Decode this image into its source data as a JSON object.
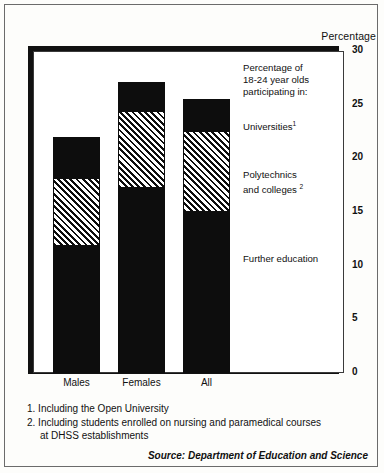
{
  "chart_data": {
    "type": "bar",
    "subtype": "stacked",
    "title": "",
    "axis_title": "Percentage",
    "xlabel": "",
    "ylabel": "Percentage",
    "ylim": [
      0,
      30
    ],
    "yticks": [
      "30",
      "25",
      "20",
      "15",
      "10",
      "5",
      "0"
    ],
    "ytick_values": [
      30,
      25,
      20,
      15,
      10,
      5,
      0
    ],
    "grid": false,
    "legend_position": "inside-right",
    "categories": [
      "Males",
      "Females",
      "All"
    ],
    "series": [
      {
        "name": "Further education",
        "values": [
          11.9,
          17.3,
          15.1
        ],
        "fill": "solid-black"
      },
      {
        "name": "Polytechnics and colleges",
        "values": [
          6.2,
          7.0,
          7.4
        ],
        "fill": "diagonal-hatch"
      },
      {
        "name": "Universities",
        "values": [
          3.9,
          2.8,
          3.0
        ],
        "fill": "solid-black"
      }
    ],
    "totals": [
      22.0,
      27.1,
      25.5
    ],
    "legend_heading": "Percentage of\n18-24 year olds\nparticipating in:"
  },
  "axis": {
    "title": "Percentage",
    "ticks": [
      "30",
      "25",
      "20",
      "15",
      "10",
      "5",
      "0"
    ]
  },
  "legend": {
    "heading_line1": "Percentage of",
    "heading_line2": "18-24 year olds",
    "heading_line3": "participating in:",
    "universities": "Universities",
    "universities_note": "1",
    "polytechnics_line1": "Polytechnics",
    "polytechnics_line2": "and colleges",
    "polytechnics_note": "2",
    "further_education": "Further education"
  },
  "categories": [
    {
      "label": "Males"
    },
    {
      "label": "Females"
    },
    {
      "label": "All"
    }
  ],
  "footnotes": [
    {
      "text": "1. Including the Open University"
    },
    {
      "text": "2. Including students enrolled on nursing and paramedical courses",
      "continuation": "at DHSS establishments"
    }
  ],
  "source": "Source: Department of Education and Science",
  "colors": {
    "ink": "#0d0d0d",
    "paper": "#fdfdfb",
    "frame": "#3a3a3a"
  }
}
